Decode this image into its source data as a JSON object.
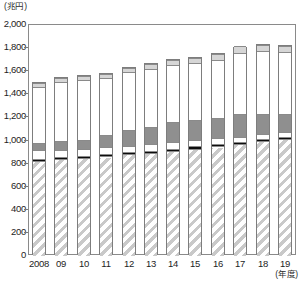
{
  "chart_data": {
    "type": "bar",
    "stacked": true,
    "title": "",
    "subtitle": "",
    "xlabel": "(年度)",
    "ylabel": "(兆円)",
    "ylim": [
      0,
      2000
    ],
    "ytick_step": 200,
    "ytick_labels": [
      "2,000",
      "1,800",
      "1,600",
      "1,400",
      "1,200",
      "1,000",
      "800",
      "600",
      "400",
      "200",
      "0"
    ],
    "ytick_values": [
      2000,
      1800,
      1600,
      1400,
      1200,
      1000,
      800,
      600,
      400,
      200,
      0
    ],
    "grid": false,
    "legend": "none",
    "categories": [
      "2008",
      "09",
      "10",
      "11",
      "12",
      "13",
      "14",
      "15",
      "16",
      "17",
      "18",
      "19"
    ],
    "series": [
      {
        "name": "hatched-bottom-segment",
        "pattern": "diagonal-hatch",
        "color": "#c9c9c9",
        "values": [
          815,
          830,
          838,
          852,
          872,
          880,
          900,
          920,
          938,
          960,
          985,
          1000
        ]
      },
      {
        "name": "white-segment-lower",
        "pattern": "solid",
        "color": "#ffffff",
        "values": [
          10,
          10,
          10,
          10,
          10,
          10,
          10,
          10,
          10,
          10,
          10,
          10
        ]
      },
      {
        "name": "black-band-segment",
        "pattern": "solid",
        "color": "#0d0d0d",
        "values": [
          18,
          18,
          18,
          18,
          18,
          18,
          18,
          18,
          18,
          18,
          18,
          18
        ]
      },
      {
        "name": "white-segment-upper",
        "pattern": "solid",
        "color": "#ffffff",
        "values": [
          72,
          62,
          64,
          62,
          52,
          62,
          60,
          57,
          54,
          42,
          47,
          47
        ]
      },
      {
        "name": "dark-gray-segment",
        "pattern": "solid",
        "color": "#8f8f8f",
        "values": [
          60,
          75,
          78,
          103,
          138,
          150,
          172,
          170,
          175,
          200,
          170,
          155
        ]
      },
      {
        "name": "tall-white-segment",
        "pattern": "solid",
        "color": "#ffffff",
        "values": [
          490,
          515,
          517,
          500,
          505,
          500,
          495,
          495,
          505,
          530,
          545,
          535
        ]
      },
      {
        "name": "light-gray-cap-segment",
        "pattern": "solid",
        "color": "#d6d6d6",
        "values": [
          35,
          35,
          35,
          35,
          35,
          45,
          45,
          45,
          45,
          55,
          55,
          55
        ]
      }
    ],
    "totals": [
      1500,
      1545,
      1560,
      1580,
      1630,
      1665,
      1700,
      1715,
      1745,
      1805,
      1830,
      1820
    ]
  },
  "axis": {
    "y_unit_label": "(兆円)",
    "x_unit_label": "(年度)"
  }
}
